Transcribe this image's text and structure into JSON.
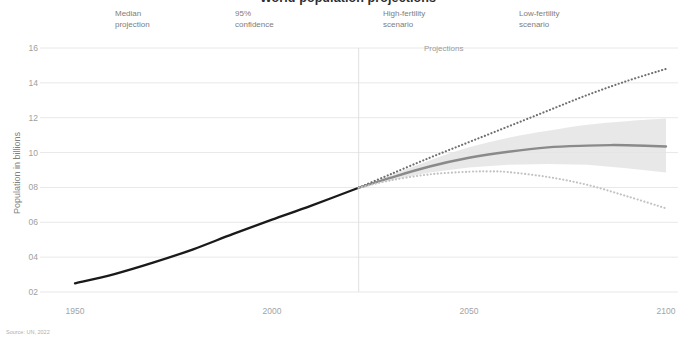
{
  "title": "World population projections",
  "source_note": "Source: UN, 2022",
  "projections_label": "Projections",
  "legend": [
    {
      "key": "median",
      "swatch": "solid-line-swatch",
      "label": "Median\nprojection"
    },
    {
      "key": "confidence",
      "swatch": "blob-swatch",
      "label": "95%\nconfidence"
    },
    {
      "key": "high_fertility",
      "swatch": "dotted-line-swatch",
      "label": "High-fertility\nscenario"
    },
    {
      "key": "low_fertility",
      "swatch": "dotted-light-swatch",
      "label": "Low-fertility\nscenario"
    }
  ],
  "colors": {
    "historical": "#1a1a1a",
    "median": "#8a8a8a",
    "high_fertility": "#6f6f6f",
    "low_fertility": "#c2c2c2",
    "confidence_band": "#e4e4e4",
    "gridline": "#e8e8e8",
    "divider": "#e0e0e0",
    "tick_text": "#a0a0a0"
  },
  "chart_data": {
    "type": "line",
    "title": "World population projections",
    "xlabel": "",
    "ylabel": "Population in billions",
    "xlim": [
      1950,
      2100
    ],
    "ylim": [
      2,
      16
    ],
    "grid": true,
    "legend_position": "top",
    "xticks": [
      "1950",
      "2000",
      "2050",
      "2100"
    ],
    "xtick_values": [
      1950,
      2000,
      2050,
      2100
    ],
    "yticks": [
      "02",
      "04",
      "06",
      "08",
      "10",
      "12",
      "14",
      "16"
    ],
    "ytick_values": [
      2,
      4,
      6,
      8,
      10,
      12,
      14,
      16
    ],
    "annotations": [
      {
        "text": "Projections",
        "x": 2022,
        "y": 15.6
      }
    ],
    "divider_x": 2022,
    "series": [
      {
        "name": "Historical",
        "style": "solid",
        "color": "#1a1a1a",
        "x": [
          1950,
          1960,
          1970,
          1980,
          1990,
          2000,
          2010,
          2022
        ],
        "values": [
          2.5,
          3.03,
          3.7,
          4.45,
          5.32,
          6.15,
          6.96,
          7.98
        ]
      },
      {
        "name": "Median projection",
        "style": "solid",
        "color": "#8a8a8a",
        "x": [
          2022,
          2030,
          2040,
          2050,
          2060,
          2070,
          2080,
          2086,
          2090,
          2100
        ],
        "values": [
          7.98,
          8.55,
          9.2,
          9.7,
          10.05,
          10.3,
          10.4,
          10.43,
          10.42,
          10.35
        ]
      },
      {
        "name": "High-fertility scenario",
        "style": "dotted",
        "color": "#6f6f6f",
        "x": [
          2022,
          2030,
          2040,
          2050,
          2060,
          2070,
          2080,
          2090,
          2100
        ],
        "values": [
          7.98,
          8.75,
          9.7,
          10.6,
          11.5,
          12.4,
          13.3,
          14.1,
          14.8
        ]
      },
      {
        "name": "Low-fertility scenario",
        "style": "dotted",
        "color": "#c2c2c2",
        "x": [
          2022,
          2030,
          2040,
          2050,
          2055,
          2060,
          2070,
          2080,
          2090,
          2100
        ],
        "values": [
          7.98,
          8.4,
          8.75,
          8.9,
          8.92,
          8.88,
          8.6,
          8.15,
          7.5,
          6.8
        ]
      }
    ],
    "confidence_band": {
      "name": "95% confidence",
      "color": "#e4e4e4",
      "x": [
        2022,
        2030,
        2040,
        2050,
        2060,
        2070,
        2080,
        2090,
        2100
      ],
      "upper": [
        7.98,
        8.7,
        9.55,
        10.3,
        10.85,
        11.25,
        11.6,
        11.8,
        11.95
      ],
      "lower": [
        7.98,
        8.4,
        8.85,
        9.15,
        9.3,
        9.35,
        9.3,
        9.1,
        8.85
      ]
    }
  }
}
